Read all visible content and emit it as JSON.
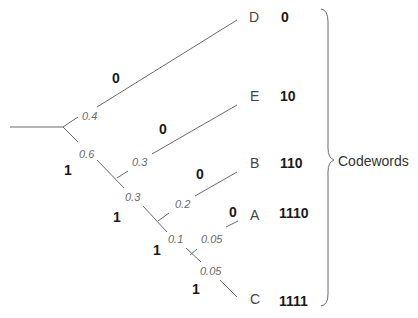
{
  "diagram": {
    "type": "huffman-code-tree",
    "root_probability": "1.0",
    "brace_label": "Codewords",
    "probabilities": {
      "d": "0.4",
      "rest1": "0.6",
      "e": "0.3",
      "rest2": "0.3",
      "b": "0.2",
      "rest3": "0.1",
      "a": "0.05",
      "c": "0.05"
    },
    "bits": {
      "d": "0",
      "rest1": "1",
      "e": "0",
      "rest2": "1",
      "b": "0",
      "rest3": "1",
      "a": "0",
      "c": "1"
    },
    "symbols": [
      {
        "symbol": "D",
        "codeword": "0"
      },
      {
        "symbol": "E",
        "codeword": "10"
      },
      {
        "symbol": "B",
        "codeword": "110"
      },
      {
        "symbol": "A",
        "codeword": "1110"
      },
      {
        "symbol": "C",
        "codeword": "1111"
      }
    ],
    "colors": {
      "edge": "#6a6a6a",
      "bit_label": "#1a1a1a",
      "probability_label": "#6a6a6a"
    }
  }
}
